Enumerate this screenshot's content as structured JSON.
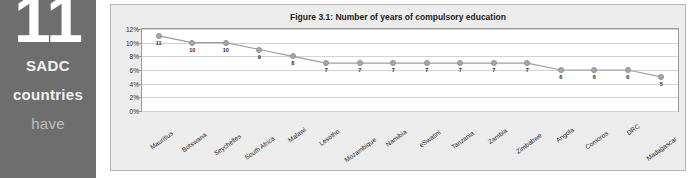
{
  "callout": {
    "number": "11",
    "line_1": "SADC",
    "line_2": "countries",
    "line_3": "have"
  },
  "figure": {
    "title": "Figure 3.1: Number of years of compulsory education"
  },
  "colors": {
    "panel_background": "#6e6e6e",
    "panel_text": "#ffffff",
    "panel_text_muted": "#bdbdbd",
    "figure_background": "#ececec",
    "plot_background": "#ffffff",
    "series_marker": "#a9a9a9",
    "series_line": "#9e9e9e",
    "gridline": "#d2d2d2",
    "axis": "#9a9a9a"
  },
  "chart_data": {
    "type": "line",
    "title": "Figure 3.1: Number of years of compulsory education",
    "xlabel": "",
    "ylabel": "",
    "grid": true,
    "legend": "none",
    "ylim": [
      0,
      12
    ],
    "ytick_labels": [
      "12%",
      "10%",
      "8%",
      "6%",
      "4%",
      "2%",
      "0%"
    ],
    "ytick_values": [
      12,
      10,
      8,
      6,
      4,
      2,
      0
    ],
    "categories": [
      "Mauritius",
      "Botswana",
      "Seychelles",
      "South Africa",
      "Malawi",
      "Lesotho",
      "Mozambique",
      "Namibia",
      "eSwatini",
      "Tanzania",
      "Zambia",
      "Zimbabwe",
      "Angola",
      "Comoros",
      "DRC",
      "Madagascar"
    ],
    "values": [
      11,
      10,
      10,
      9,
      8,
      7,
      7,
      7,
      7,
      7,
      7,
      7,
      6,
      6,
      6,
      5
    ],
    "point_labels": [
      "11",
      "10",
      "10",
      "9",
      "8",
      "7",
      "7",
      "7",
      "7",
      "7",
      "7",
      "7",
      "6",
      "6",
      "6",
      "5"
    ]
  }
}
